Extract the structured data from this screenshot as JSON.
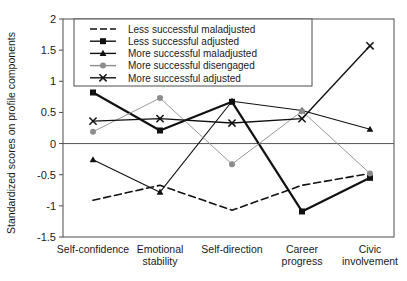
{
  "chart_data": {
    "type": "line",
    "title": "",
    "xlabel": "",
    "ylabel": "Standardized scores on profile components",
    "ylim": [
      -1.5,
      2
    ],
    "yticks": [
      "2",
      "1.5",
      "1",
      "0.5",
      "0",
      "-0.5",
      "-1",
      "-1.5"
    ],
    "ytick_values": [
      2,
      1.5,
      1,
      0.5,
      0,
      -0.5,
      -1,
      -1.5
    ],
    "grid": false,
    "zero_line": true,
    "legend_position": "top-center-inside",
    "categories": [
      "Self-confidence",
      "Emotional stability",
      "Self-direction",
      "Career progress",
      "Civic involvement"
    ],
    "category_lines": [
      [
        "Self-confidence"
      ],
      [
        "Emotional",
        "stability"
      ],
      [
        "Self-direction"
      ],
      [
        "Career",
        "progress"
      ],
      [
        "Civic",
        "involvement"
      ]
    ],
    "series": [
      {
        "name": "Less successful maladjusted",
        "marker": "none",
        "line_style": "dashed",
        "line_width": 1.6,
        "color": "#111111",
        "values": [
          -0.91,
          -0.67,
          -1.07,
          -0.67,
          -0.48
        ]
      },
      {
        "name": "Less successful adjusted",
        "marker": "square",
        "line_style": "solid",
        "line_width": 2.2,
        "color": "#111111",
        "values": [
          0.82,
          0.21,
          0.67,
          -1.09,
          -0.55
        ]
      },
      {
        "name": "More successful maladjusted",
        "marker": "triangle",
        "line_style": "solid",
        "line_width": 1.1,
        "color": "#111111",
        "values": [
          -0.26,
          -0.78,
          0.68,
          0.53,
          0.23
        ]
      },
      {
        "name": "More successful disengaged",
        "marker": "circle",
        "line_style": "solid",
        "line_width": 0.9,
        "color": "#8c8c8c",
        "values": [
          0.19,
          0.73,
          -0.33,
          0.52,
          -0.48
        ]
      },
      {
        "name": "More successful adjusted",
        "marker": "x",
        "line_style": "solid",
        "line_width": 1.4,
        "color": "#111111",
        "values": [
          0.36,
          0.4,
          0.33,
          0.4,
          1.57
        ]
      }
    ]
  },
  "legend": {
    "items": [
      "Less successful maladjusted",
      "Less successful adjusted",
      "More successful maladjusted",
      "More successful disengaged",
      "More successful adjusted"
    ]
  }
}
